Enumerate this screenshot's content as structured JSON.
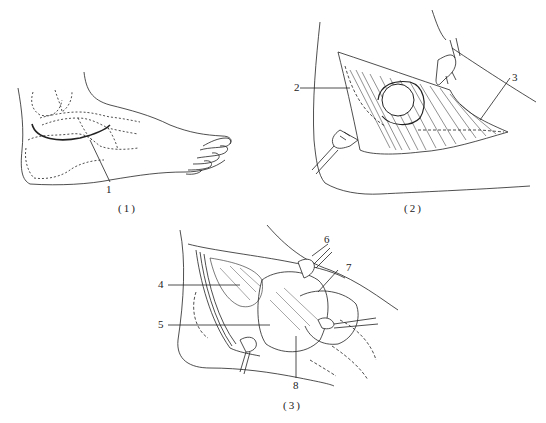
{
  "figure": {
    "panels": [
      {
        "id": "panel-1",
        "caption": "(1)",
        "subject": "lateral view of foot with incision line",
        "labels": [
          {
            "number": "1"
          }
        ]
      },
      {
        "id": "panel-2",
        "caption": "(2)",
        "subject": "skin flap retracted exposing mass",
        "labels": [
          {
            "number": "2"
          },
          {
            "number": "3"
          }
        ]
      },
      {
        "id": "panel-3",
        "caption": "(3)",
        "subject": "deep dissection with retractors",
        "labels": [
          {
            "number": "4"
          },
          {
            "number": "5"
          },
          {
            "number": "6"
          },
          {
            "number": "7"
          },
          {
            "number": "8"
          }
        ]
      }
    ],
    "colors": {
      "ink": "#222222",
      "background": "#ffffff"
    }
  }
}
